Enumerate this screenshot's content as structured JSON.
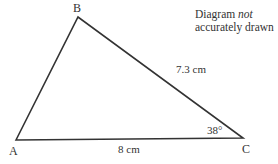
{
  "diagram": {
    "type": "triangle",
    "vertices": {
      "A": {
        "label": "A",
        "x": 16,
        "y": 140
      },
      "B": {
        "label": "B",
        "x": 78,
        "y": 17
      },
      "C": {
        "label": "C",
        "x": 243,
        "y": 138
      }
    },
    "sides": {
      "BC": {
        "label": "7.3 cm"
      },
      "AC": {
        "label": "8 cm"
      }
    },
    "angles": {
      "C": {
        "label": "38°"
      }
    },
    "note": {
      "line1_prefix": "Diagram ",
      "line1_emph": "not",
      "line2": "accurately drawn"
    },
    "colors": {
      "stroke": "#333333",
      "text": "#333333",
      "background": "#ffffff"
    }
  }
}
